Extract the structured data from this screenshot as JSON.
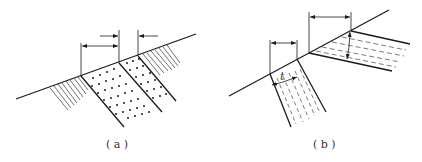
{
  "figure": {
    "panels": [
      {
        "id": "a",
        "label": "( a )",
        "description": "Inclined sandstone strata (dotted) between hatched layers cut by slope surface, with horizontal outcrop width dimensions"
      },
      {
        "id": "b",
        "label": "( b )",
        "description": "Two dashed-fill strata intersecting slope surface, showing horizontal outcrop width and true thickness t"
      }
    ],
    "thickness_symbol": "t"
  }
}
